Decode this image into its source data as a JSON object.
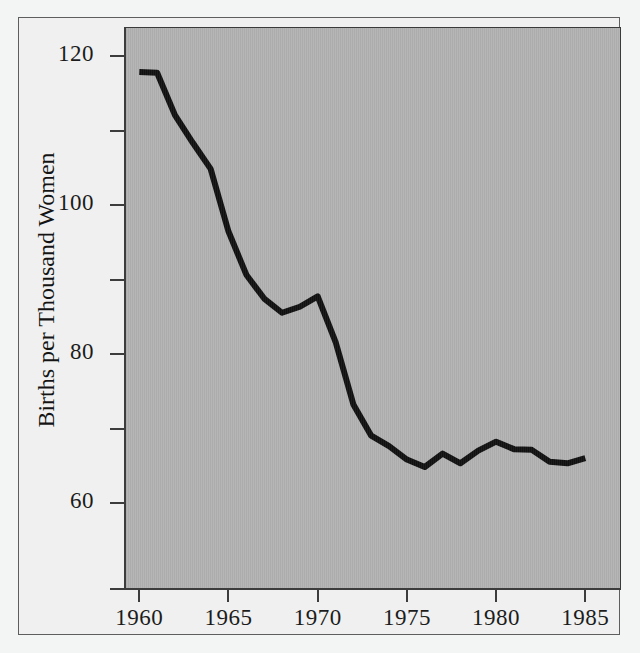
{
  "figure": {
    "background_color": "#eff0ef",
    "panel_color": "#b2b2b2",
    "frame_color": "#5e5e5e",
    "axis_color": "#3c3c3c"
  },
  "axes": {
    "y_title": "Births per Thousand Women",
    "y_ticks_labeled": [
      "120",
      "100",
      "80",
      "60"
    ],
    "y_ticks_minor_count": 3,
    "x_ticks": [
      "1960",
      "1965",
      "1970",
      "1975",
      "1980",
      "1985"
    ]
  },
  "chart_data": {
    "type": "line",
    "title": "",
    "subtitle": "",
    "xlabel": "",
    "ylabel": "Births per Thousand Women",
    "xlim": [
      1959.2,
      1987.0
    ],
    "ylim": [
      48.5,
      123.9
    ],
    "xtick_values": [
      1960,
      1965,
      1970,
      1975,
      1980,
      1985
    ],
    "xtick_labels": [
      "1960",
      "1965",
      "1970",
      "1975",
      "1980",
      "1985"
    ],
    "ytick_values": [
      120,
      110,
      100,
      90,
      80,
      70,
      60
    ],
    "ytick_labels": [
      "120",
      "",
      "100",
      "",
      "80",
      "",
      "60"
    ],
    "grid": false,
    "legend": false,
    "series": [
      {
        "name": "General Fertility Rate",
        "color": "#111111",
        "line_width": 6,
        "x": [
          1960,
          1961,
          1962,
          1963,
          1964,
          1965,
          1966,
          1967,
          1968,
          1969,
          1970,
          1971,
          1972,
          1973,
          1974,
          1975,
          1976,
          1977,
          1978,
          1979,
          1980,
          1981,
          1982,
          1983,
          1984,
          1985
        ],
        "y": [
          118.0,
          117.9,
          112.2,
          108.5,
          105.0,
          96.6,
          90.8,
          87.6,
          85.7,
          86.5,
          87.9,
          81.8,
          73.4,
          69.2,
          67.8,
          66.0,
          65.0,
          66.8,
          65.5,
          67.2,
          68.4,
          67.4,
          67.3,
          65.7,
          65.5,
          66.2
        ]
      }
    ]
  }
}
